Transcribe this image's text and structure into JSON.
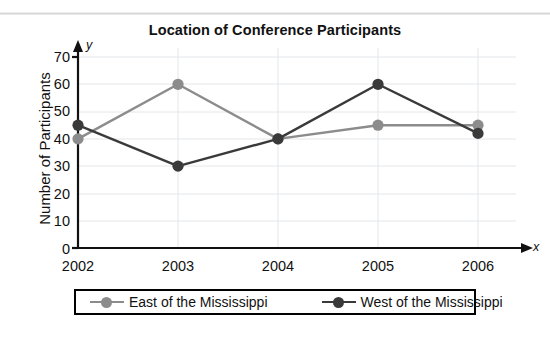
{
  "chart_data": {
    "type": "line",
    "title": "Location of Conference Participants",
    "xlabel": "x",
    "ylabel": "Number of Participants",
    "axis_letters": {
      "y": "y",
      "x": "x"
    },
    "categories": [
      "2002",
      "2003",
      "2004",
      "2005",
      "2006"
    ],
    "xlim": [
      2002,
      2006
    ],
    "ylim": [
      0,
      70
    ],
    "yticks": [
      "70",
      "60",
      "50",
      "40",
      "30",
      "20",
      "10",
      "0"
    ],
    "ytick_values": [
      70,
      60,
      50,
      40,
      30,
      20,
      10,
      0
    ],
    "grid": true,
    "legend_position": "bottom",
    "series": [
      {
        "name": "East of the Mississippi",
        "color": "#8c8c8c",
        "values": [
          40,
          60,
          40,
          45,
          45
        ]
      },
      {
        "name": "West of the Mississippi",
        "color": "#3a3a3a",
        "values": [
          45,
          30,
          40,
          60,
          42
        ]
      }
    ]
  },
  "legend": {
    "entries": [
      {
        "label": "East of the Mississippi"
      },
      {
        "label": "West of the Mississippi"
      }
    ]
  }
}
